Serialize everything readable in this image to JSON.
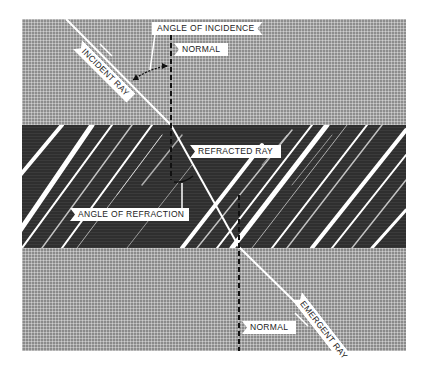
{
  "figure": {
    "labels": {
      "angle_of_incidence": "ANGLE OF INCIDENCE",
      "normal_top": "NORMAL",
      "incident_ray": "INCIDENT RAY",
      "refracted_ray": "REFRACTED RAY",
      "angle_of_refraction": "ANGLE OF REFRACTION",
      "emergent_ray": "EMERGENT RAY",
      "normal_bottom": "NORMAL"
    },
    "regions": [
      {
        "name": "top-medium",
        "fill": "#8d8d8d"
      },
      {
        "name": "dense-medium",
        "fill": "#2f2f2f"
      },
      {
        "name": "bottom-medium",
        "fill": "#8a8a8a"
      }
    ],
    "geometry": {
      "entry_point": [
        171,
        125
      ],
      "exit_point": [
        239,
        247
      ]
    }
  }
}
